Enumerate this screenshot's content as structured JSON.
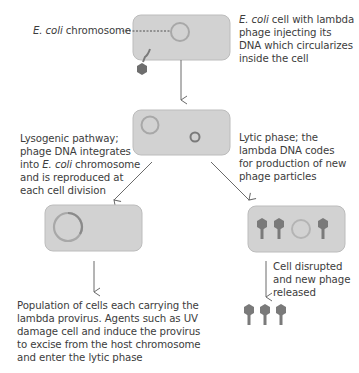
{
  "diagram": {
    "colors": {
      "cell_fill": "#d2d2d2",
      "cell_stroke": "#bcbcbc",
      "dna_ring": "#9c9c9c",
      "phage_dna_ring": "#6e6e6e",
      "phage": "#7a7a7a",
      "arrow": "#6a6a6a",
      "text": "#3c3c3c"
    },
    "labels": {
      "chromosome_label": {
        "italic": "E. coli",
        "rest": " chromosome"
      },
      "step1": {
        "line1_italic": "E. coli",
        "line1_rest": " cell with lambda",
        "line2": "phage injecting its",
        "line3": "DNA which circularizes",
        "line4": "inside the cell"
      },
      "lysogenic": {
        "line1": "Lysogenic pathway;",
        "line2": "phage DNA integrates",
        "line3_pre": "into ",
        "line3_italic": "E. coli",
        "line3_post": " chromosome",
        "line4": "and is reproduced at",
        "line5": "each cell division"
      },
      "lytic": {
        "line1": "Lytic phase; the",
        "line2": "lambda DNA codes",
        "line3": "for production of new",
        "line4": "phage particles"
      },
      "release": {
        "line1": "Cell disrupted",
        "line2": "and new phage",
        "line3": "released"
      },
      "provirus": {
        "line1": "Population of cells each carrying the",
        "line2": "lambda provirus. Agents such as UV",
        "line3": "damage cell and induce the provirus",
        "line4": "to excise from the host chromosome",
        "line5": "and enter the lytic phase"
      }
    },
    "stages": [
      {
        "name": "infection",
        "phages_inside": 0
      },
      {
        "name": "circularized",
        "phages_inside": 0
      },
      {
        "name": "lysogen",
        "phages_inside": 0
      },
      {
        "name": "lytic-assembly",
        "phages_inside": 3
      },
      {
        "name": "released",
        "phages_free": 3
      }
    ]
  }
}
